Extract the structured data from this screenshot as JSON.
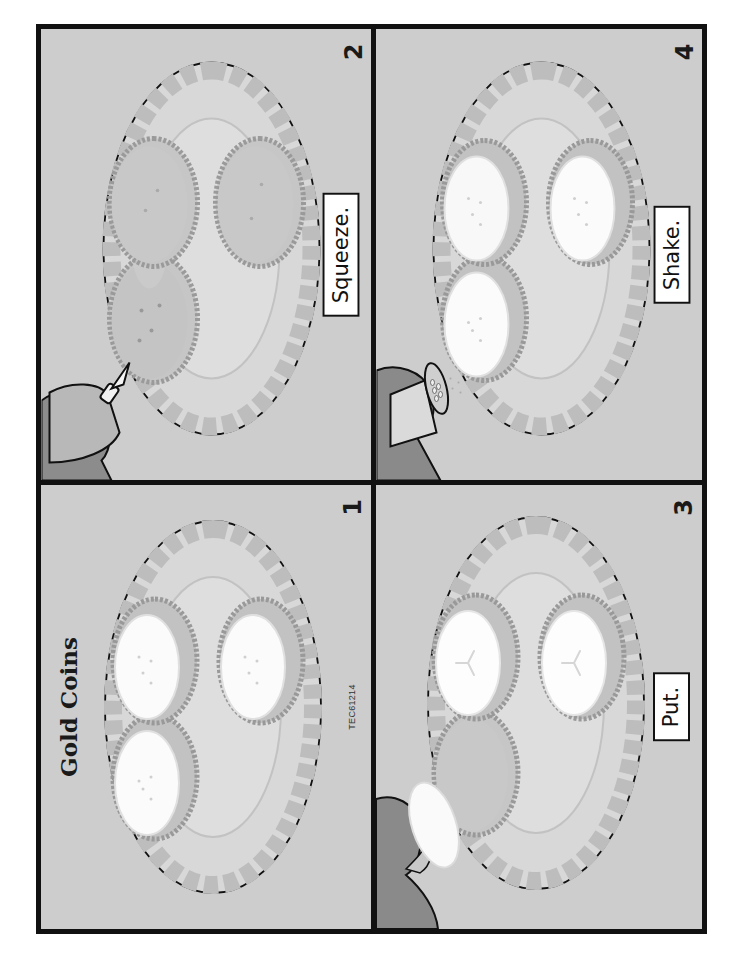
{
  "worksheet": {
    "title": "Gold Coins",
    "code": "TEC61214",
    "orientation": "rotated -90deg (landscape content on portrait page)"
  },
  "panels": [
    {
      "step": "1",
      "caption": "",
      "scene": "plate with three crackers, each topped with cucumber slice and sprinkled seasoning"
    },
    {
      "step": "2",
      "caption": "Squeeze.",
      "scene": "hand squeezing bottle onto cracker on plate"
    },
    {
      "step": "3",
      "caption": "Put.",
      "scene": "hand placing cucumber slice onto cracker on plate"
    },
    {
      "step": "4",
      "caption": "Shake.",
      "scene": "hand shaking seasoning shaker over crackers with cucumber slices"
    }
  ],
  "colors": {
    "panel_bg": "#cdcdcd",
    "plate_fill": "#dcdcdc",
    "plate_petal": "#c4c4c4",
    "cracker": "#c2c2c2",
    "cracker_edge": "#9e9e9e",
    "cucumber": "#f6f6f6",
    "hand": "#8a8a8a",
    "border": "#111111"
  }
}
